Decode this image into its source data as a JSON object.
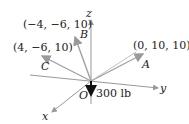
{
  "axes": {
    "x_label": "x",
    "y_label": "y",
    "z_label": "z",
    "origin_label": "O"
  },
  "vectors": [
    {
      "name": "A",
      "coords_label": "(0, 10, 10)"
    },
    {
      "name": "B",
      "coords_label": "(−4, −6, 10)"
    },
    {
      "name": "C",
      "coords_label": "(4, −6, 10)"
    }
  ],
  "load": {
    "label": "300 lb"
  },
  "colors": {
    "axis": "#999999",
    "vector": "#a0a0a0",
    "load": "#111111",
    "text": "#222222"
  }
}
